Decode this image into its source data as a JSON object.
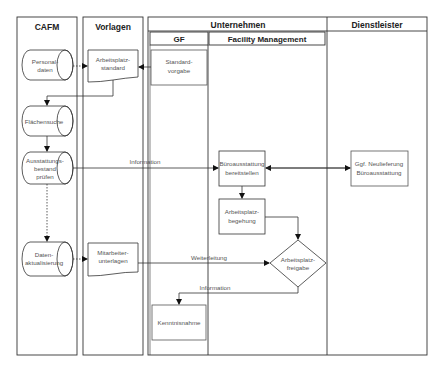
{
  "lanes": {
    "cafm": "CAFM",
    "vorlagen": "Vorlagen",
    "unternehmen": "Unternehmen",
    "gf": "GF",
    "fm": "Facility Management",
    "dienstleister": "Dienstleister"
  },
  "nodes": {
    "personaldaten": [
      "Personal-",
      "daten"
    ],
    "flaechensuche": [
      "Flächensuche"
    ],
    "ausstattung": [
      "Ausstattungs-",
      "bestand",
      "prüfen"
    ],
    "datenaktualisierung": [
      "Daten-",
      "aktualisierung"
    ],
    "arbeitsplatzstandard": [
      "Arbeitsplatz-",
      "standard"
    ],
    "mitarbeiterunterlagen": [
      "Mitarbeiter-",
      "unterlagen"
    ],
    "standardvorgabe": [
      "Standard-",
      "vorgabe"
    ],
    "kenntnisnahme": [
      "Kenntnisnahme"
    ],
    "bueroausstattung": [
      "Büroausstattung",
      "bereitstellen"
    ],
    "begehung": [
      "Arbeitsplatz-",
      "begehung"
    ],
    "freigabe": [
      "Arbeitsplatz-",
      "freigabe"
    ],
    "neulieferung": [
      "Ggf. Neulieferung",
      "Büroausstattung"
    ]
  },
  "edges": {
    "information1": "Information",
    "weiterleitung": "Weiterleitung",
    "information2": "Information"
  },
  "colors": {
    "line": "#333333",
    "text": "#555555",
    "header_text": "#222222",
    "background": "#ffffff"
  }
}
